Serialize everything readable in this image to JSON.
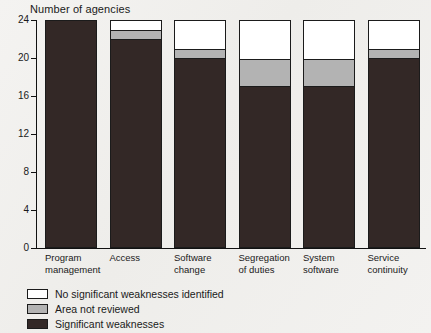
{
  "chart_data": {
    "type": "bar",
    "subtype": "stacked-bar",
    "title": "Number of agencies",
    "xlabel": "",
    "ylabel": "",
    "ylim": [
      0,
      24
    ],
    "yticks": [
      0,
      4,
      8,
      12,
      16,
      20,
      24
    ],
    "ytick_labels": [
      "0",
      "4",
      "8",
      "12",
      "16",
      "20",
      "24"
    ],
    "grid": false,
    "legend_position": "bottom-left",
    "categories": [
      "Program\nmanagement",
      "Access",
      "Software\nchange",
      "Segregation\nof duties",
      "System\nsoftware",
      "Service\ncontinuity"
    ],
    "series": [
      {
        "name": "Significant weaknesses",
        "color": "#332826",
        "values": [
          24,
          22,
          20,
          17,
          17,
          20
        ]
      },
      {
        "name": "Area not reviewed",
        "color": "#b3b3b3",
        "values": [
          0,
          1,
          1,
          3,
          3,
          1
        ]
      },
      {
        "name": "No significant weaknesses identified",
        "color": "#ffffff",
        "values": [
          0,
          1,
          3,
          4,
          4,
          3
        ]
      }
    ],
    "totals": [
      24,
      24,
      24,
      24,
      24,
      24
    ]
  },
  "legend": {
    "items": [
      {
        "label": "No significant weaknesses identified",
        "color": "#ffffff"
      },
      {
        "label": "Area not reviewed",
        "color": "#b3b3b3"
      },
      {
        "label": "Significant weaknesses",
        "color": "#332826"
      }
    ]
  }
}
